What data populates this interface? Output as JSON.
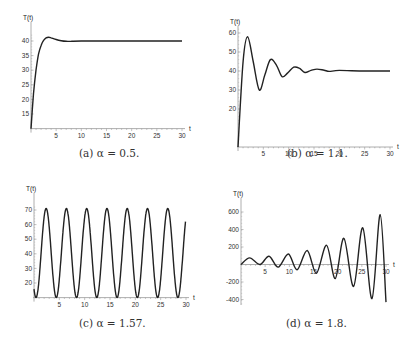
{
  "captions": {
    "a": "(a) α = 0.5.",
    "b": "(b) α = 1.1.",
    "c": "(c) α = 1.57.",
    "d": "(d) α = 1.8."
  },
  "chart_data": [
    {
      "type": "line",
      "title": "(a) alpha = 0.5",
      "xlabel": "t",
      "ylabel": "T(t)",
      "xlim": [
        0,
        30
      ],
      "ylim": [
        10,
        42
      ],
      "xticks": [
        5,
        10,
        15,
        20,
        25,
        30
      ],
      "yticks": [
        15,
        20,
        25,
        30,
        35,
        40
      ],
      "x": [
        0,
        0.5,
        1,
        1.5,
        2,
        2.5,
        3,
        3.5,
        4,
        5,
        6,
        7,
        8,
        10,
        15,
        20,
        25,
        30
      ],
      "values": [
        10,
        22,
        30,
        35.5,
        38.5,
        40.2,
        41.1,
        41.3,
        41.1,
        40.5,
        40.1,
        39.9,
        39.9,
        40,
        40,
        40,
        40,
        40
      ]
    },
    {
      "type": "line",
      "title": "(b) alpha = 1.1",
      "xlabel": "t",
      "ylabel": "T(t)",
      "xlim": [
        0,
        30
      ],
      "ylim": [
        0,
        62
      ],
      "xticks": [
        5,
        10,
        15,
        20,
        25,
        30
      ],
      "yticks": [
        20,
        30,
        40,
        50,
        60
      ],
      "x": [
        0,
        1,
        1.9,
        3,
        4.2,
        5.3,
        6.4,
        7.6,
        8.7,
        9.8,
        11,
        12.1,
        13.2,
        14.4,
        15.6,
        17,
        18,
        20,
        25,
        30
      ],
      "values": [
        0,
        45,
        58,
        45,
        30,
        38,
        46,
        43,
        37,
        39,
        42,
        41.5,
        39.2,
        40.3,
        41,
        40.4,
        39.8,
        40.3,
        40,
        40
      ]
    },
    {
      "type": "line",
      "title": "(c) alpha = 1.57",
      "xlabel": "t",
      "ylabel": "T(t)",
      "xlim": [
        0,
        30
      ],
      "ylim": [
        10,
        72
      ],
      "xticks": [
        5,
        10,
        15,
        20,
        25,
        30
      ],
      "yticks": [
        20,
        30,
        40,
        50,
        60,
        70
      ],
      "period": 4.0,
      "amplitude_range": [
        10,
        71
      ],
      "peaks_t": [
        1.8,
        5.8,
        9.8,
        13.8,
        17.8,
        21.8,
        25.8,
        29.8
      ],
      "troughs_t": [
        3.8,
        7.8,
        11.8,
        15.8,
        19.8,
        23.8,
        27.8
      ]
    },
    {
      "type": "line",
      "title": "(d) alpha = 1.8",
      "xlabel": "t",
      "ylabel": "T(t)",
      "xlim": [
        0,
        30
      ],
      "ylim": [
        -450,
        620
      ],
      "xticks": [
        5,
        10,
        15,
        20,
        25,
        30
      ],
      "yticks": [
        -400,
        -200,
        200,
        400,
        600
      ],
      "peaks": [
        [
          1.8,
          75
        ],
        [
          5.8,
          95
        ],
        [
          9.8,
          120
        ],
        [
          13.7,
          160
        ],
        [
          17.7,
          220
        ],
        [
          21.3,
          300
        ],
        [
          25.2,
          420
        ],
        [
          28.8,
          570
        ]
      ],
      "troughs": [
        [
          3.9,
          0
        ],
        [
          7.7,
          -30
        ],
        [
          11.6,
          -60
        ],
        [
          15.6,
          -100
        ],
        [
          19.5,
          -160
        ],
        [
          23.3,
          -250
        ],
        [
          27.1,
          -390
        ],
        [
          30,
          -430
        ]
      ]
    }
  ]
}
